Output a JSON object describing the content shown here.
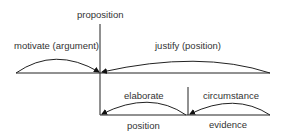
{
  "diagram": {
    "type": "rst-tree",
    "nodes": {
      "root": "proposition",
      "position": "position",
      "evidence": "evidence"
    },
    "relations": {
      "motivate": "motivate (argument)",
      "justify": "justify (position)",
      "elaborate": "elaborate",
      "circumstance": "circumstance"
    },
    "colors": {
      "line": "#222222",
      "text": "#333333",
      "background": "#ffffff"
    }
  }
}
